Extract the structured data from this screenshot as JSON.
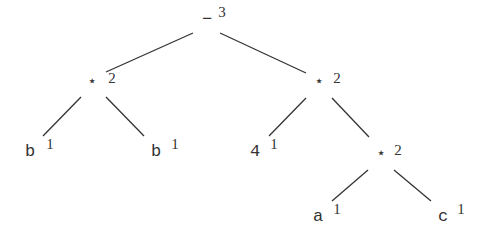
{
  "diagram": {
    "type": "expression-tree",
    "nodes": [
      {
        "id": "n0",
        "label": "−",
        "count": "3",
        "x": 207,
        "y": 24,
        "cx": 222,
        "cy": 17
      },
      {
        "id": "n1",
        "label": "⋆",
        "count": "2",
        "x": 92,
        "y": 87,
        "cx": 112,
        "cy": 83
      },
      {
        "id": "n2",
        "label": "⋆",
        "count": "2",
        "x": 319,
        "y": 87,
        "cx": 337,
        "cy": 83
      },
      {
        "id": "n3",
        "label": "b",
        "count": "1",
        "x": 30,
        "y": 156,
        "cx": 50,
        "cy": 149
      },
      {
        "id": "n4",
        "label": "b",
        "count": "1",
        "x": 156,
        "y": 156,
        "cx": 175,
        "cy": 149
      },
      {
        "id": "n5",
        "label": "4",
        "count": "1",
        "x": 255,
        "y": 156,
        "cx": 274,
        "cy": 149
      },
      {
        "id": "n6",
        "label": "⋆",
        "count": "2",
        "x": 381,
        "y": 159,
        "cx": 398,
        "cy": 155
      },
      {
        "id": "n7",
        "label": "a",
        "count": "1",
        "x": 318,
        "y": 221,
        "cx": 337,
        "cy": 214
      },
      {
        "id": "n8",
        "label": "c",
        "count": "1",
        "x": 443,
        "y": 221,
        "cx": 461,
        "cy": 214
      }
    ],
    "edges": [
      {
        "from": "n0",
        "to": "n1",
        "x1": 193,
        "y1": 33,
        "x2": 106,
        "y2": 72
      },
      {
        "from": "n0",
        "to": "n2",
        "x1": 220,
        "y1": 33,
        "x2": 306,
        "y2": 73
      },
      {
        "from": "n1",
        "to": "n3",
        "x1": 81,
        "y1": 97,
        "x2": 43,
        "y2": 136
      },
      {
        "from": "n1",
        "to": "n4",
        "x1": 106,
        "y1": 97,
        "x2": 144,
        "y2": 136
      },
      {
        "from": "n2",
        "to": "n5",
        "x1": 306,
        "y1": 98,
        "x2": 269,
        "y2": 136
      },
      {
        "from": "n2",
        "to": "n6",
        "x1": 332,
        "y1": 98,
        "x2": 369,
        "y2": 137
      },
      {
        "from": "n6",
        "to": "n7",
        "x1": 368,
        "y1": 170,
        "x2": 332,
        "y2": 201
      },
      {
        "from": "n6",
        "to": "n8",
        "x1": 394,
        "y1": 170,
        "x2": 431,
        "y2": 201
      }
    ]
  }
}
